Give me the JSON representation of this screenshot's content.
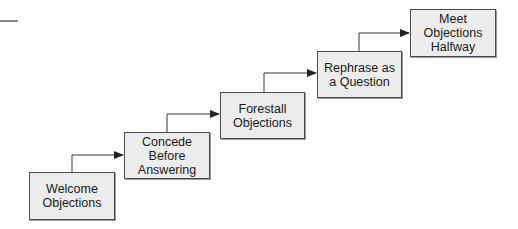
{
  "diagram": {
    "type": "staircase-flow",
    "steps": [
      {
        "label": "Welcome\nObjections",
        "x": 29,
        "y": 172,
        "w": 86,
        "h": 48
      },
      {
        "label": "Concede\nBefore\nAnswering",
        "x": 124,
        "y": 132,
        "w": 86,
        "h": 47
      },
      {
        "label": "Forestall\nObjections",
        "x": 220,
        "y": 92,
        "w": 85,
        "h": 47
      },
      {
        "label": "Rephrase as\na Question",
        "x": 317,
        "y": 51,
        "w": 85,
        "h": 47
      },
      {
        "label": "Meet\nObjections\nHalfway",
        "x": 410,
        "y": 9,
        "w": 86,
        "h": 48
      }
    ],
    "connectors": [
      {
        "from": 0,
        "to": 1,
        "points": [
          [
            72,
            172
          ],
          [
            72,
            155
          ],
          [
            123,
            155
          ]
        ]
      },
      {
        "from": 1,
        "to": 2,
        "points": [
          [
            167,
            132
          ],
          [
            167,
            114
          ],
          [
            219,
            114
          ]
        ]
      },
      {
        "from": 2,
        "to": 3,
        "points": [
          [
            264,
            92
          ],
          [
            264,
            73
          ],
          [
            316,
            73
          ]
        ]
      },
      {
        "from": 3,
        "to": 4,
        "points": [
          [
            359,
            51
          ],
          [
            359,
            33
          ],
          [
            409,
            33
          ]
        ]
      }
    ],
    "colors": {
      "box_fill": "#ececec",
      "box_border": "#4a4a4a",
      "line": "#333333"
    }
  }
}
